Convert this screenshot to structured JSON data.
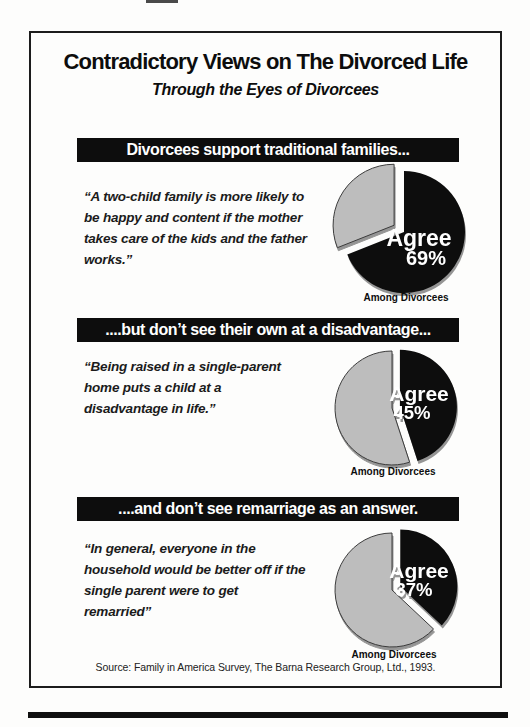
{
  "page": {
    "title": "Contradictory Views on The Divorced Life",
    "subtitle": "Through the Eyes of Divorcees",
    "source": "Source: Family in America Survey, The Barna Research Group, Ltd., 1993."
  },
  "chart_data": [
    {
      "type": "pie",
      "header": "Divorcees support traditional families...",
      "quote": "“A two-child family is more likely to\nbe happy and content if the mother\ntakes care of the kids and the father\nworks.”",
      "caption": "Among Divorcees",
      "value_label": "Agree",
      "value_text": "69%",
      "slices": [
        {
          "label": "Agree",
          "value": 69,
          "color": "#0d0d0d",
          "exploded": false
        },
        {
          "label": "",
          "value": 31,
          "color": "#bdbdbd",
          "exploded": true
        }
      ]
    },
    {
      "type": "pie",
      "header": "....but don’t see their own at a disadvantage...",
      "quote": "“Being raised in a single-parent\nhome puts a child at a\ndisadvantage in life.”",
      "caption": "Among Divorcees",
      "value_label": "Agree",
      "value_text": "45%",
      "slices": [
        {
          "label": "Agree",
          "value": 45,
          "color": "#0d0d0d",
          "exploded": true
        },
        {
          "label": "",
          "value": 55,
          "color": "#bdbdbd",
          "exploded": false
        }
      ]
    },
    {
      "type": "pie",
      "header": "....and don’t see remarriage as an answer.",
      "quote": "“In general, everyone in the\nhousehold would be better off if the\nsingle parent were to get\nremarried”",
      "caption": "Among Divorcees",
      "value_label": "Agree",
      "value_text": "37%",
      "slices": [
        {
          "label": "Agree",
          "value": 37,
          "color": "#0d0d0d",
          "exploded": true
        },
        {
          "label": "",
          "value": 63,
          "color": "#bdbdbd",
          "exploded": false
        }
      ]
    }
  ]
}
